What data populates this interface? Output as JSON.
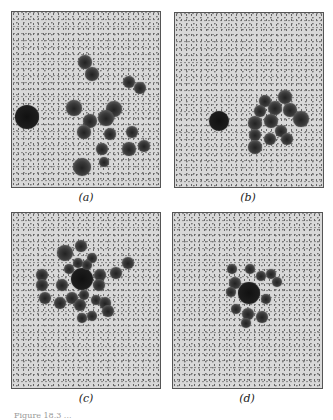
{
  "figure": {
    "panels": [
      {
        "id": "a",
        "label": "(a)",
        "box": {
          "x": 11,
          "y": 11,
          "w": 150,
          "h": 177
        },
        "label_pos": {
          "x": 86,
          "y": 191
        },
        "blobs": [
          {
            "x": 15,
            "y": 105,
            "r": 12,
            "big": true
          },
          {
            "x": 62,
            "y": 96,
            "r": 8
          },
          {
            "x": 73,
            "y": 50,
            "r": 7
          },
          {
            "x": 80,
            "y": 62,
            "r": 7
          },
          {
            "x": 117,
            "y": 70,
            "r": 6
          },
          {
            "x": 128,
            "y": 76,
            "r": 6
          },
          {
            "x": 102,
            "y": 97,
            "r": 8
          },
          {
            "x": 94,
            "y": 106,
            "r": 8
          },
          {
            "x": 78,
            "y": 109,
            "r": 7
          },
          {
            "x": 72,
            "y": 120,
            "r": 7
          },
          {
            "x": 98,
            "y": 122,
            "r": 6
          },
          {
            "x": 120,
            "y": 120,
            "r": 6
          },
          {
            "x": 90,
            "y": 137,
            "r": 6
          },
          {
            "x": 117,
            "y": 137,
            "r": 7
          },
          {
            "x": 132,
            "y": 134,
            "r": 6
          },
          {
            "x": 92,
            "y": 150,
            "r": 5
          },
          {
            "x": 70,
            "y": 155,
            "r": 9
          }
        ]
      },
      {
        "id": "b",
        "label": "(b)",
        "box": {
          "x": 174,
          "y": 12,
          "w": 150,
          "h": 176
        },
        "label_pos": {
          "x": 248,
          "y": 191
        },
        "blobs": [
          {
            "x": 44,
            "y": 108,
            "r": 10,
            "big": true
          },
          {
            "x": 90,
            "y": 88,
            "r": 6
          },
          {
            "x": 110,
            "y": 84,
            "r": 7
          },
          {
            "x": 85,
            "y": 98,
            "r": 6
          },
          {
            "x": 100,
            "y": 95,
            "r": 7
          },
          {
            "x": 115,
            "y": 97,
            "r": 7
          },
          {
            "x": 80,
            "y": 110,
            "r": 7
          },
          {
            "x": 96,
            "y": 108,
            "r": 7
          },
          {
            "x": 126,
            "y": 106,
            "r": 8
          },
          {
            "x": 80,
            "y": 122,
            "r": 6
          },
          {
            "x": 106,
            "y": 118,
            "r": 6
          },
          {
            "x": 95,
            "y": 126,
            "r": 6
          },
          {
            "x": 112,
            "y": 126,
            "r": 6
          },
          {
            "x": 80,
            "y": 134,
            "r": 7
          }
        ]
      },
      {
        "id": "c",
        "label": "(c)",
        "box": {
          "x": 11,
          "y": 212,
          "w": 150,
          "h": 177
        },
        "label_pos": {
          "x": 86,
          "y": 392
        },
        "blobs": [
          {
            "x": 70,
            "y": 66,
            "r": 11,
            "big": true
          },
          {
            "x": 53,
            "y": 40,
            "r": 8
          },
          {
            "x": 69,
            "y": 33,
            "r": 6
          },
          {
            "x": 80,
            "y": 45,
            "r": 5
          },
          {
            "x": 66,
            "y": 50,
            "r": 5
          },
          {
            "x": 75,
            "y": 52,
            "r": 5
          },
          {
            "x": 57,
            "y": 56,
            "r": 5
          },
          {
            "x": 30,
            "y": 62,
            "r": 6
          },
          {
            "x": 30,
            "y": 72,
            "r": 6
          },
          {
            "x": 50,
            "y": 72,
            "r": 6
          },
          {
            "x": 88,
            "y": 62,
            "r": 6
          },
          {
            "x": 87,
            "y": 72,
            "r": 6
          },
          {
            "x": 104,
            "y": 60,
            "r": 6
          },
          {
            "x": 116,
            "y": 50,
            "r": 6
          },
          {
            "x": 33,
            "y": 85,
            "r": 6
          },
          {
            "x": 48,
            "y": 90,
            "r": 6
          },
          {
            "x": 60,
            "y": 85,
            "r": 6
          },
          {
            "x": 68,
            "y": 92,
            "r": 6
          },
          {
            "x": 72,
            "y": 82,
            "r": 5
          },
          {
            "x": 84,
            "y": 87,
            "r": 5
          },
          {
            "x": 93,
            "y": 90,
            "r": 6
          },
          {
            "x": 96,
            "y": 98,
            "r": 6
          },
          {
            "x": 70,
            "y": 105,
            "r": 5
          },
          {
            "x": 80,
            "y": 103,
            "r": 5
          }
        ]
      },
      {
        "id": "d",
        "label": "(d)",
        "box": {
          "x": 172,
          "y": 212,
          "w": 151,
          "h": 177
        },
        "label_pos": {
          "x": 247,
          "y": 392
        },
        "blobs": [
          {
            "x": 76,
            "y": 80,
            "r": 11,
            "big": true
          },
          {
            "x": 59,
            "y": 56,
            "r": 5
          },
          {
            "x": 77,
            "y": 56,
            "r": 5
          },
          {
            "x": 88,
            "y": 63,
            "r": 5
          },
          {
            "x": 98,
            "y": 61,
            "r": 5
          },
          {
            "x": 104,
            "y": 69,
            "r": 5
          },
          {
            "x": 62,
            "y": 70,
            "r": 6
          },
          {
            "x": 58,
            "y": 79,
            "r": 5
          },
          {
            "x": 93,
            "y": 86,
            "r": 5
          },
          {
            "x": 63,
            "y": 96,
            "r": 5
          },
          {
            "x": 75,
            "y": 101,
            "r": 6
          },
          {
            "x": 89,
            "y": 104,
            "r": 6
          },
          {
            "x": 73,
            "y": 110,
            "r": 5
          }
        ]
      }
    ],
    "caption": "Figure 18.3 ..."
  },
  "colors": {
    "background": "#d8d8d8",
    "border": "#555555",
    "blob": "#2a2a2a"
  }
}
